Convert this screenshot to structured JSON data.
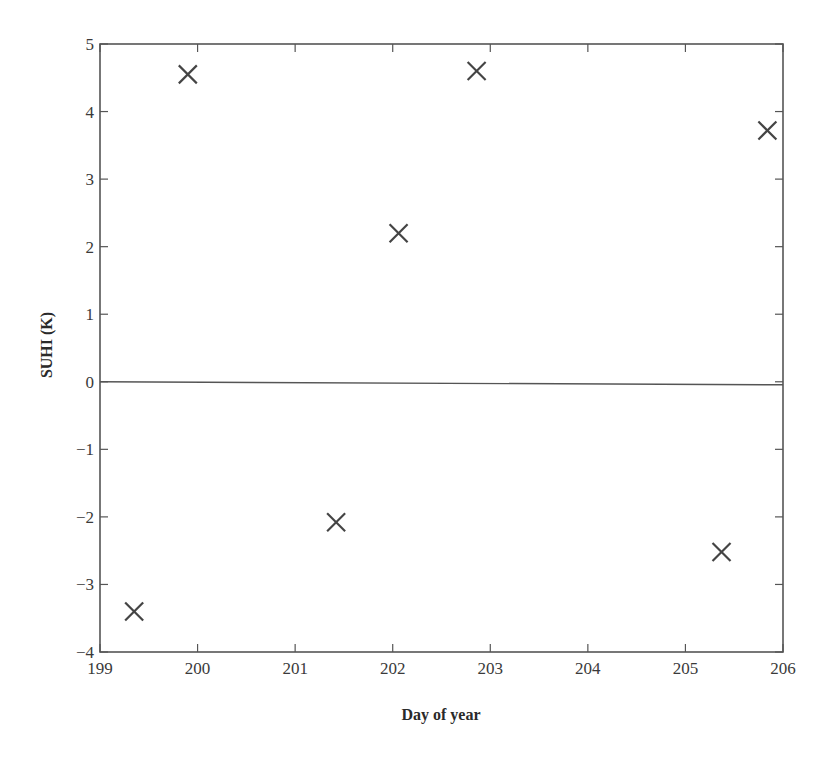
{
  "chart_data": {
    "type": "scatter",
    "title": "",
    "xlabel": "Day of year",
    "ylabel": "SUHI (K)",
    "xlim": [
      199,
      206
    ],
    "ylim": [
      -4,
      5
    ],
    "xticks": [
      199,
      200,
      201,
      202,
      203,
      204,
      205,
      206
    ],
    "yticks": [
      -4,
      -3,
      -2,
      -1,
      0,
      1,
      2,
      3,
      4,
      5
    ],
    "xtick_labels": [
      "199",
      "200",
      "201",
      "202",
      "203",
      "204",
      "205",
      "206"
    ],
    "ytick_labels": [
      "−4",
      "−3",
      "−2",
      "−1",
      "0",
      "1",
      "2",
      "3",
      "4",
      "5"
    ],
    "grid": false,
    "legend": null,
    "reference_lines": [
      {
        "axis": "y",
        "value": 0
      }
    ],
    "marker": "x",
    "series": [
      {
        "name": "SUHI",
        "points": [
          {
            "x": 199.35,
            "y": -3.4
          },
          {
            "x": 199.9,
            "y": 4.55
          },
          {
            "x": 201.42,
            "y": -2.08
          },
          {
            "x": 202.06,
            "y": 2.2
          },
          {
            "x": 202.86,
            "y": 4.6
          },
          {
            "x": 205.37,
            "y": -2.52
          },
          {
            "x": 205.84,
            "y": 3.72
          }
        ]
      }
    ]
  }
}
